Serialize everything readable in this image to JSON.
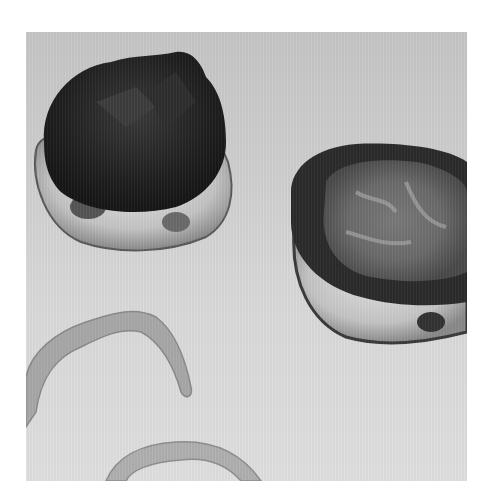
{
  "image": {
    "type": "grayscale-photograph",
    "colors": {
      "background": "#ffffff",
      "surface": "#d4d4d4",
      "dark_specimen": "#2a2a2a",
      "pale_tissue": "#cfcfcf",
      "strip": "#a9a9a9"
    },
    "objects": [
      {
        "name": "left-specimen",
        "description": "dark rounded specimen with pale lobed base"
      },
      {
        "name": "right-specimen",
        "description": "ring-shaped specimen with dark rim and mottled center"
      },
      {
        "name": "curved-strip-upper",
        "description": "pale curved tissue strip"
      },
      {
        "name": "curved-strip-lower",
        "description": "pale curved tissue strip partially cropped"
      }
    ]
  }
}
